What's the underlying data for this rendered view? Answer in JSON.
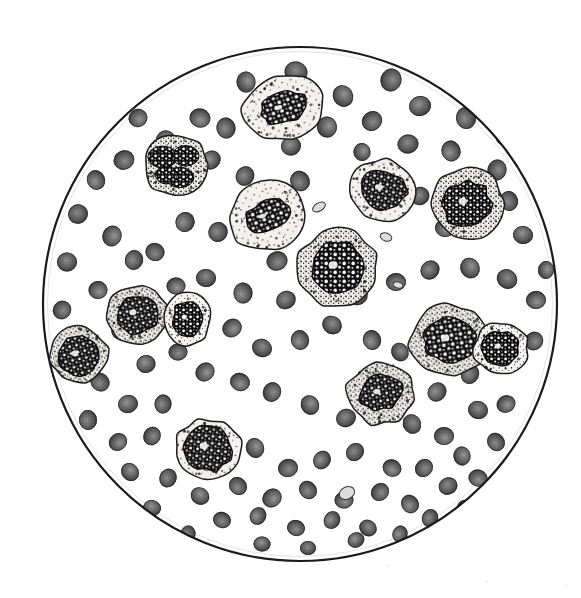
{
  "figure": {
    "medium": "halftone line-and-stipple engraving",
    "field": {
      "shape": "circle",
      "center_x": 300,
      "center_y": 304,
      "radius": 258,
      "rim_color": "#1a1a1a",
      "rim_width": 2,
      "background_color": "#ffffff"
    },
    "page_background": "#ffffff",
    "caption": "",
    "stray_marks": [
      {
        "x": 388,
        "y": 566,
        "text": "·"
      },
      {
        "x": 487,
        "y": 582,
        "text": "·"
      },
      {
        "x": 566,
        "y": 586,
        "text": "·"
      }
    ]
  },
  "legend": {
    "erythrocyte_label": "red blood cell",
    "erythrocyte_color": "#5d5d5d",
    "erythrocyte_core_color": "#8d8d8d",
    "erythrocyte_edge_color": "#3a3a3a",
    "leukocyte_label": "white blood cell",
    "cytoplasm_color": "#f2f0ec",
    "cytoplasm_edge_color": "#222222",
    "nucleus_color": "#141414",
    "granule_color": "#2a2a2a",
    "platelet_label": "platelet",
    "platelet_color": "#d8d8d8"
  },
  "counts": {
    "erythrocytes": 118,
    "leukocytes": 12,
    "platelets": 5
  },
  "erythrocytes": [
    [
      246,
      82,
      21,
      19
    ],
    [
      296,
      72,
      23,
      21
    ],
    [
      343,
      96,
      22,
      20
    ],
    [
      391,
      80,
      23,
      21
    ],
    [
      200,
      118,
      21,
      19
    ],
    [
      166,
      140,
      20,
      19
    ],
    [
      138,
      118,
      19,
      18
    ],
    [
      226,
      128,
      21,
      19
    ],
    [
      327,
      127,
      21,
      20
    ],
    [
      372,
      121,
      21,
      19
    ],
    [
      420,
      106,
      22,
      20
    ],
    [
      466,
      118,
      22,
      20
    ],
    [
      505,
      135,
      21,
      19
    ],
    [
      124,
      160,
      21,
      19
    ],
    [
      211,
      160,
      20,
      18
    ],
    [
      245,
      176,
      20,
      18
    ],
    [
      291,
      146,
      20,
      19
    ],
    [
      300,
      181,
      21,
      19
    ],
    [
      362,
      152,
      18,
      17
    ],
    [
      408,
      144,
      21,
      19
    ],
    [
      451,
      151,
      21,
      19
    ],
    [
      497,
      170,
      21,
      19
    ],
    [
      96,
      180,
      20,
      18
    ],
    [
      78,
      214,
      20,
      19
    ],
    [
      112,
      236,
      21,
      19
    ],
    [
      134,
      260,
      20,
      18
    ],
    [
      185,
      222,
      20,
      19
    ],
    [
      218,
      232,
      20,
      19
    ],
    [
      263,
      224,
      21,
      19
    ],
    [
      277,
      261,
      21,
      19
    ],
    [
      386,
      206,
      20,
      18
    ],
    [
      420,
      196,
      19,
      18
    ],
    [
      445,
      228,
      20,
      18
    ],
    [
      509,
      201,
      20,
      18
    ],
    [
      523,
      235,
      20,
      18
    ],
    [
      67,
      262,
      20,
      19
    ],
    [
      98,
      290,
      19,
      18
    ],
    [
      155,
      252,
      19,
      18
    ],
    [
      176,
      286,
      19,
      17
    ],
    [
      206,
      278,
      20,
      18
    ],
    [
      243,
      293,
      21,
      19
    ],
    [
      286,
      300,
      20,
      18
    ],
    [
      320,
      276,
      20,
      18
    ],
    [
      358,
      296,
      20,
      18
    ],
    [
      396,
      282,
      20,
      18
    ],
    [
      430,
      270,
      20,
      18
    ],
    [
      470,
      268,
      21,
      19
    ],
    [
      507,
      279,
      21,
      19
    ],
    [
      536,
      300,
      20,
      18
    ],
    [
      62,
      310,
      19,
      18
    ],
    [
      85,
      344,
      20,
      18
    ],
    [
      120,
      330,
      19,
      17
    ],
    [
      232,
      328,
      20,
      18
    ],
    [
      262,
      348,
      20,
      18
    ],
    [
      300,
      340,
      20,
      18
    ],
    [
      332,
      325,
      20,
      18
    ],
    [
      372,
      340,
      20,
      18
    ],
    [
      400,
      352,
      19,
      17
    ],
    [
      437,
      392,
      20,
      18
    ],
    [
      470,
      374,
      20,
      18
    ],
    [
      505,
      362,
      20,
      18
    ],
    [
      534,
      341,
      19,
      18
    ],
    [
      146,
      364,
      19,
      18
    ],
    [
      178,
      352,
      19,
      17
    ],
    [
      205,
      372,
      20,
      18
    ],
    [
      100,
      382,
      20,
      18
    ],
    [
      128,
      404,
      20,
      18
    ],
    [
      163,
      404,
      19,
      17
    ],
    [
      240,
      382,
      20,
      18
    ],
    [
      272,
      392,
      20,
      18
    ],
    [
      310,
      405,
      20,
      18
    ],
    [
      346,
      418,
      20,
      18
    ],
    [
      380,
      404,
      20,
      18
    ],
    [
      412,
      424,
      20,
      18
    ],
    [
      444,
      436,
      20,
      18
    ],
    [
      478,
      410,
      20,
      18
    ],
    [
      506,
      404,
      19,
      17
    ],
    [
      88,
      420,
      20,
      18
    ],
    [
      118,
      442,
      19,
      17
    ],
    [
      152,
      436,
      19,
      17
    ],
    [
      194,
      442,
      19,
      17
    ],
    [
      222,
      462,
      19,
      17
    ],
    [
      255,
      448,
      20,
      18
    ],
    [
      288,
      468,
      20,
      18
    ],
    [
      322,
      460,
      19,
      17
    ],
    [
      355,
      452,
      19,
      17
    ],
    [
      392,
      468,
      19,
      17
    ],
    [
      424,
      468,
      19,
      17
    ],
    [
      462,
      456,
      19,
      17
    ],
    [
      496,
      442,
      19,
      17
    ],
    [
      130,
      472,
      19,
      17
    ],
    [
      168,
      478,
      19,
      17
    ],
    [
      200,
      496,
      19,
      17
    ],
    [
      238,
      486,
      19,
      17
    ],
    [
      272,
      498,
      20,
      18
    ],
    [
      308,
      490,
      19,
      17
    ],
    [
      344,
      500,
      19,
      17
    ],
    [
      380,
      492,
      19,
      17
    ],
    [
      410,
      504,
      19,
      17
    ],
    [
      448,
      486,
      19,
      17
    ],
    [
      478,
      478,
      19,
      17
    ],
    [
      102,
      498,
      18,
      16
    ],
    [
      152,
      508,
      18,
      16
    ],
    [
      222,
      520,
      18,
      16
    ],
    [
      258,
      516,
      18,
      16
    ],
    [
      296,
      528,
      18,
      16
    ],
    [
      332,
      520,
      18,
      16
    ],
    [
      368,
      528,
      18,
      16
    ],
    [
      400,
      534,
      17,
      15
    ],
    [
      430,
      518,
      18,
      16
    ],
    [
      466,
      508,
      18,
      16
    ],
    [
      188,
      534,
      17,
      15
    ],
    [
      262,
      544,
      17,
      15
    ],
    [
      308,
      548,
      16,
      14
    ],
    [
      356,
      540,
      17,
      15
    ],
    [
      392,
      552,
      16,
      14
    ],
    [
      148,
      322,
      18,
      16
    ],
    [
      57,
      360,
      17,
      16
    ],
    [
      546,
      270,
      18,
      16
    ]
  ],
  "leukocytes": [
    {
      "cx": 283,
      "cy": 108,
      "rx": 40,
      "ry": 32,
      "rot": -18,
      "nrx": 24,
      "nry": 15,
      "nrot": -15,
      "type": "monocyte"
    },
    {
      "cx": 176,
      "cy": 166,
      "rx": 32,
      "ry": 30,
      "rot": 0,
      "nrx": 21,
      "nry": 18,
      "nrot": 10,
      "type": "neutrophil"
    },
    {
      "cx": 267,
      "cy": 216,
      "rx": 40,
      "ry": 34,
      "rot": -22,
      "nrx": 23,
      "nry": 14,
      "nrot": -22,
      "type": "monocyte"
    },
    {
      "cx": 383,
      "cy": 190,
      "rx": 35,
      "ry": 30,
      "rot": 8,
      "nrx": 24,
      "nry": 19,
      "nrot": 6,
      "type": "monocyte"
    },
    {
      "cx": 467,
      "cy": 204,
      "rx": 36,
      "ry": 35,
      "rot": 0,
      "nrx": 24,
      "nry": 23,
      "nrot": 0,
      "type": "myelocyte"
    },
    {
      "cx": 338,
      "cy": 268,
      "rx": 40,
      "ry": 38,
      "rot": 0,
      "nrx": 27,
      "nry": 25,
      "nrot": 0,
      "type": "myeloblast"
    },
    {
      "cx": 137,
      "cy": 314,
      "rx": 31,
      "ry": 29,
      "rot": -10,
      "nrx": 21,
      "nry": 19,
      "nrot": -10,
      "type": "myelocyte"
    },
    {
      "cx": 187,
      "cy": 319,
      "rx": 24,
      "ry": 26,
      "rot": 0,
      "nrx": 15,
      "nry": 17,
      "nrot": 0,
      "type": "lymphocyte"
    },
    {
      "cx": 79,
      "cy": 355,
      "rx": 29,
      "ry": 28,
      "rot": -12,
      "nrx": 20,
      "nry": 20,
      "nrot": -12,
      "type": "myelocyte"
    },
    {
      "cx": 450,
      "cy": 340,
      "rx": 40,
      "ry": 35,
      "rot": -8,
      "nrx": 25,
      "nry": 23,
      "nrot": -8,
      "type": "myelocyte"
    },
    {
      "cx": 501,
      "cy": 348,
      "rx": 27,
      "ry": 26,
      "rot": 0,
      "nrx": 18,
      "nry": 17,
      "nrot": 0,
      "type": "lymphocyte"
    },
    {
      "cx": 381,
      "cy": 393,
      "rx": 34,
      "ry": 31,
      "rot": -8,
      "nrx": 22,
      "nry": 17,
      "nrot": -8,
      "type": "myelocyte"
    },
    {
      "cx": 208,
      "cy": 449,
      "rx": 33,
      "ry": 30,
      "rot": 6,
      "nrx": 25,
      "nry": 22,
      "nrot": 6,
      "type": "monocyte"
    }
  ],
  "platelets": [
    [
      319,
      207,
      7,
      4,
      -30
    ],
    [
      386,
      237,
      6,
      4,
      20
    ],
    [
      364,
      253,
      5,
      3,
      -10
    ],
    [
      398,
      285,
      5,
      3,
      15
    ],
    [
      347,
      493,
      8,
      6,
      -25
    ]
  ]
}
